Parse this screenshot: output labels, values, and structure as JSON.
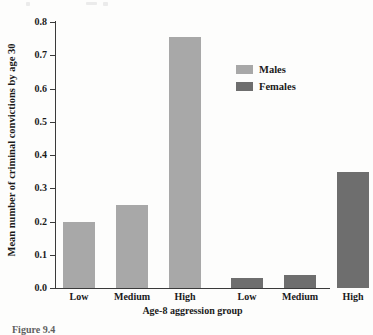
{
  "figure": {
    "caption": "Figure 9.4"
  },
  "legend": {
    "position": "upper-right",
    "entries": [
      {
        "label": "Males",
        "color": "#a8a8a8",
        "swatch_name": "legend-swatch-males"
      },
      {
        "label": "Females",
        "color": "#6e6e6e",
        "swatch_name": "legend-swatch-females"
      }
    ]
  },
  "chart_data": {
    "type": "bar",
    "title": "",
    "xlabel": "Age-8 aggression group",
    "ylabel": "Mean number of criminal convictions by age 30",
    "ylim": [
      0.0,
      0.8
    ],
    "grid": false,
    "legend_position": "upper right",
    "categories": [
      "Low",
      "Medium",
      "High"
    ],
    "y_ticks": [
      "0.0",
      "0.1",
      "0.2",
      "0.3",
      "0.4",
      "0.5",
      "0.6",
      "0.7",
      "0.8"
    ],
    "y_tick_values": [
      0.0,
      0.1,
      0.2,
      0.3,
      0.4,
      0.5,
      0.6,
      0.7,
      0.8
    ],
    "x_tick_labels": [
      "Low",
      "Medium",
      "High",
      "Low",
      "Medium",
      "High"
    ],
    "series": [
      {
        "name": "Males",
        "color": "#a8a8a8",
        "values": [
          0.2,
          0.25,
          0.755
        ]
      },
      {
        "name": "Females",
        "color": "#6e6e6e",
        "values": [
          0.03,
          0.04,
          0.35
        ]
      }
    ],
    "bars": [
      {
        "label": "Low",
        "series": "Males",
        "value": 0.2,
        "color": "#a8a8a8"
      },
      {
        "label": "Medium",
        "series": "Males",
        "value": 0.25,
        "color": "#a8a8a8"
      },
      {
        "label": "High",
        "series": "Males",
        "value": 0.755,
        "color": "#a8a8a8"
      },
      {
        "label": "Low",
        "series": "Females",
        "value": 0.03,
        "color": "#6e6e6e"
      },
      {
        "label": "Medium",
        "series": "Females",
        "value": 0.04,
        "color": "#6e6e6e"
      },
      {
        "label": "High",
        "series": "Females",
        "value": 0.35,
        "color": "#6e6e6e"
      }
    ]
  }
}
